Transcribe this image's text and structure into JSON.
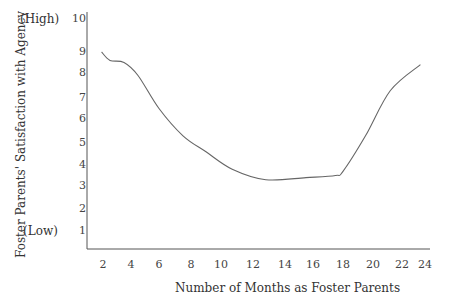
{
  "chart_data": {
    "type": "line",
    "title": "",
    "xlabel": "Number of Months as Foster Parents",
    "ylabel": "Foster Parents' Satisfaction with Agency",
    "xlim": [
      1,
      24.5
    ],
    "ylim": [
      0.2,
      10
    ],
    "grid": false,
    "legend": null,
    "x_ticks": [
      "2",
      "4",
      "6",
      "8",
      "10",
      "12",
      "14",
      "16",
      "18",
      "20",
      "22",
      "24"
    ],
    "y_ticks": [
      "1",
      "2",
      "3",
      "4",
      "5",
      "6",
      "7",
      "8",
      "9",
      "10"
    ],
    "y_annotations": {
      "high": "(High)",
      "low": "(Low)"
    },
    "series": [
      {
        "name": "Satisfaction",
        "x": [
          1.9,
          2.5,
          3.5,
          4.5,
          6.0,
          7.5,
          9.0,
          10.7,
          12.8,
          15.5,
          17.5,
          18.0,
          19.5,
          21.2,
          23.6
        ],
        "y": [
          9.0,
          8.6,
          8.5,
          7.9,
          6.5,
          5.3,
          4.6,
          3.8,
          3.3,
          3.4,
          3.5,
          3.7,
          5.3,
          7.3,
          8.4
        ]
      }
    ]
  }
}
